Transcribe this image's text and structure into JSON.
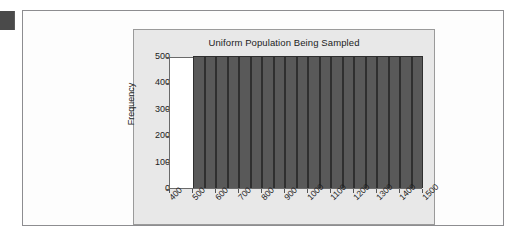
{
  "page": {
    "edge_marker_name": "page-edge-marker"
  },
  "chart_data": {
    "type": "bar",
    "title": "Uniform Population Being Sampled",
    "xlabel": "",
    "ylabel": "Frequency",
    "ylim": [
      0,
      500
    ],
    "xlim": [
      400,
      1500
    ],
    "grid": false,
    "legend": "none",
    "y_ticks": [
      0,
      100,
      200,
      300,
      400,
      500
    ],
    "y_tick_labels": [
      "0",
      "100",
      "200",
      "300",
      "400",
      "500"
    ],
    "x_ticks": [
      400,
      500,
      600,
      700,
      800,
      900,
      1000,
      1100,
      1200,
      1300,
      1400,
      1500
    ],
    "x_tick_labels": [
      "400",
      "500",
      "600",
      "700",
      "800",
      "900",
      "1000",
      "1100",
      "1200",
      "1300",
      "1400",
      "1500"
    ],
    "bin_width": 50,
    "bin_edges": [
      500,
      550,
      600,
      650,
      700,
      750,
      800,
      850,
      900,
      950,
      1000,
      1050,
      1100,
      1150,
      1200,
      1250,
      1300,
      1350,
      1400,
      1450,
      1500
    ],
    "categories": [
      "500-550",
      "550-600",
      "600-650",
      "650-700",
      "700-750",
      "750-800",
      "800-850",
      "850-900",
      "900-950",
      "950-1000",
      "1000-1050",
      "1050-1100",
      "1100-1150",
      "1150-1200",
      "1200-1250",
      "1250-1300",
      "1300-1350",
      "1350-1400",
      "1400-1450",
      "1450-1500"
    ],
    "values": [
      500,
      500,
      500,
      500,
      500,
      500,
      500,
      500,
      500,
      500,
      500,
      500,
      500,
      500,
      500,
      500,
      500,
      500,
      500,
      500
    ],
    "colors": {
      "bar_fill": "#595959",
      "bar_edge": "#2f2f2f",
      "panel_background": "#e8e8e8",
      "plot_background": "#ffffff",
      "axis": "#555555",
      "text": "#1c1c1c"
    }
  }
}
